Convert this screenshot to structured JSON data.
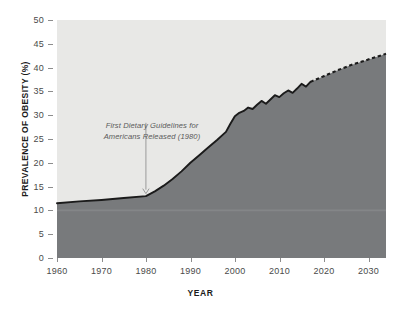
{
  "chart_data": {
    "type": "area",
    "title": "",
    "xlabel": "YEAR",
    "ylabel": "PREVALENCE OF OBESITY (%)",
    "xlim": [
      1960,
      2034
    ],
    "ylim": [
      0,
      50
    ],
    "xticks": [
      "1960",
      "1970",
      "1980",
      "1990",
      "2000",
      "2010",
      "2020",
      "2030"
    ],
    "yticks": [
      "0",
      "5",
      "10",
      "15",
      "20",
      "25",
      "30",
      "35",
      "40",
      "45",
      "50"
    ],
    "grid": false,
    "legend": "none",
    "series": [
      {
        "name": "Observed prevalence of obesity",
        "style": "solid",
        "x": [
          1960,
          1965,
          1970,
          1975,
          1980,
          1982,
          1984,
          1986,
          1988,
          1990,
          1992,
          1994,
          1996,
          1998,
          1999,
          2000,
          2001,
          2002,
          2003,
          2004,
          2005,
          2006,
          2007,
          2008,
          2009,
          2010,
          2011,
          2012,
          2013,
          2014,
          2015,
          2016,
          2017
        ],
        "y": [
          11.5,
          11.9,
          12.2,
          12.6,
          13.0,
          14.0,
          15.2,
          16.6,
          18.2,
          20.0,
          21.6,
          23.2,
          24.8,
          26.5,
          28.2,
          29.8,
          30.5,
          30.9,
          31.6,
          31.3,
          32.2,
          33.0,
          32.4,
          33.3,
          34.2,
          33.8,
          34.6,
          35.2,
          34.7,
          35.6,
          36.6,
          36.0,
          37.0
        ],
        "color": "#1b1b1b"
      },
      {
        "name": "Projected prevalence of obesity",
        "style": "dashed",
        "x": [
          2017,
          2020,
          2023,
          2026,
          2029,
          2032,
          2034
        ],
        "y": [
          37.0,
          38.2,
          39.4,
          40.5,
          41.4,
          42.3,
          42.9
        ],
        "color": "#1b1b1b"
      }
    ],
    "fill_color": "#787a7c",
    "plot_background": "#e8e8e6",
    "annotations": [
      {
        "text_line_1": "First Dietary Guidelines for",
        "text_line_2": "Americans Released (1980)",
        "points_to_year": 1980,
        "points_to_value": 13.0,
        "arrow_color": "#9a9a9a"
      }
    ]
  },
  "colors": {
    "page_background": "#ffffff",
    "axis_text": "#4a4a4a",
    "axis_title": "#1b1b1b",
    "annotation_text": "#5a5a5a"
  }
}
